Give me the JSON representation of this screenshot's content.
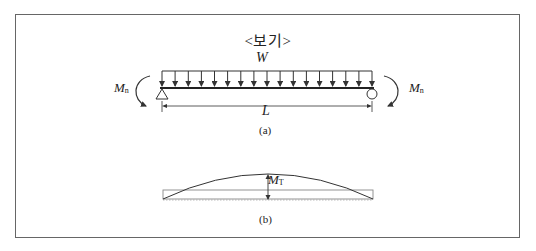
{
  "figure": {
    "title": "<보기>",
    "panel_a": {
      "caption": "(a)",
      "load_label": "W",
      "span_label": "L",
      "left_moment": {
        "symbol": "M",
        "subscript": "n"
      },
      "right_moment": {
        "symbol": "M",
        "subscript": "n"
      },
      "load_arrow_count": 17,
      "left_support": "pin (triangle)",
      "right_support": "roller (circle)"
    },
    "panel_b": {
      "caption": "(b)",
      "moment_label": {
        "symbol": "M",
        "subscript": "T"
      },
      "diagram": "parabolic moment curve over rectangular baseline"
    }
  },
  "colors": {
    "line": "#333333",
    "frame": "#666666",
    "light_line": "#999999"
  }
}
